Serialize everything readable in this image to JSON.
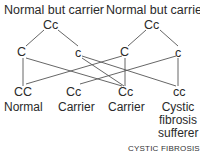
{
  "parents": [
    {
      "label": "Normal but carrier",
      "genotype": "Cc",
      "alleles": [
        "C",
        "c"
      ]
    },
    {
      "label": "Normal but carrier",
      "genotype": "Cc",
      "alleles": [
        "C",
        "c"
      ]
    }
  ],
  "children": [
    {
      "genotype": "CC",
      "label": "Normal"
    },
    {
      "genotype": "Cc",
      "label": "Carrier"
    },
    {
      "genotype": "Cc",
      "label": "Carrier"
    },
    {
      "genotype": "cc",
      "label_lines": [
        "Cystic",
        "fibrosis",
        "sufferer"
      ]
    }
  ],
  "caption": "CYSTIC FIBROSIS",
  "colors": {
    "line": "#555555",
    "text": "#2a2a2a"
  }
}
